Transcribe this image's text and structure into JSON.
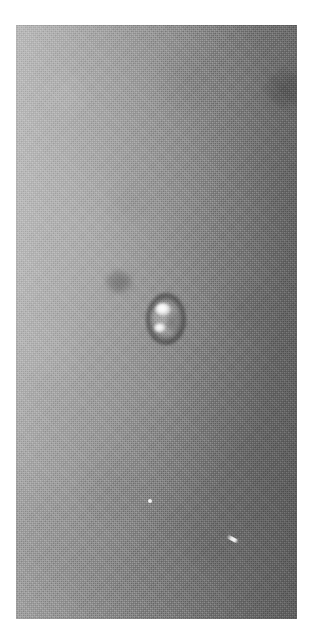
{
  "image": {
    "kind": "grayscale-photomicrograph",
    "caption": "",
    "background_description": "mottled gray photographic plate with fine halftone grain",
    "plate": {
      "left_px": 16,
      "top_px": 25,
      "width_px": 281,
      "height_px": 594,
      "margin_color": "#ffffff",
      "gradient_light_color": "#b4b4b4",
      "gradient_dark_color": "#6a6a6a",
      "gradient_direction": "left-to-right-darkening"
    },
    "features": [
      {
        "name": "droplet",
        "label": "bright droplet with dark halo",
        "center_x_px": 150,
        "center_y_px": 294,
        "width_px": 40,
        "height_px": 52,
        "highlight_color": "#ffffff",
        "halo_color": "#1a1a1a"
      },
      {
        "name": "faint-dark-spot",
        "label": "faint diffuse dark spot",
        "center_x_px": 103,
        "center_y_px": 257,
        "width_px": 30,
        "height_px": 26
      },
      {
        "name": "dark-blotch-top-right",
        "label": "dark blotch upper right",
        "center_x_px": 271,
        "center_y_px": 64,
        "width_px": 46,
        "height_px": 40
      },
      {
        "name": "speck-upper",
        "label": "small bright speck",
        "center_x_px": 134,
        "center_y_px": 476
      },
      {
        "name": "speck-streak",
        "label": "small bright diagonal streak",
        "center_x_px": 216,
        "center_y_px": 514
      }
    ]
  }
}
